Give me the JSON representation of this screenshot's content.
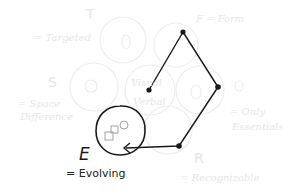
{
  "diagram": {
    "labels": {
      "T": {
        "letter": "T",
        "meaning": "= Targeted"
      },
      "F": {
        "letter": "F",
        "meaning": "F = Form"
      },
      "S": {
        "letter": "S",
        "meaning_line1": "= Space",
        "meaning_line2": "Difference"
      },
      "V": {
        "line1": "Visual",
        "line2": "Verbal"
      },
      "O": {
        "meaning_line1": "= Only",
        "meaning_line2": "Essentials"
      },
      "R": {
        "letter": "R",
        "meaning": "= Recognizable"
      },
      "E": {
        "letter": "E",
        "meaning": "= Evolving"
      }
    },
    "path_points": [
      {
        "x": 149,
        "y": 90
      },
      {
        "x": 183,
        "y": 32
      },
      {
        "x": 218,
        "y": 87
      },
      {
        "x": 179,
        "y": 146
      }
    ],
    "arrow_target": {
      "x": 124,
      "y": 148
    },
    "highlight_circle": {
      "cx": 120,
      "cy": 130,
      "r": 24
    },
    "colors": {
      "ink": "#1a1a1a",
      "faint": "#eeeeee",
      "background": "#ffffff"
    }
  }
}
